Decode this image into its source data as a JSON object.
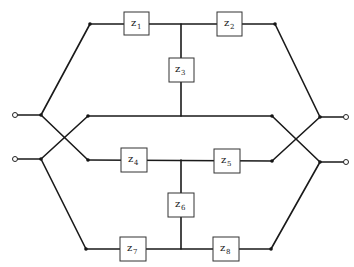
{
  "diagram": {
    "type": "circuit",
    "impedances": [
      {
        "id": "z1",
        "base": "z",
        "sub": "1"
      },
      {
        "id": "z2",
        "base": "z",
        "sub": "2"
      },
      {
        "id": "z3",
        "base": "z",
        "sub": "3"
      },
      {
        "id": "z4",
        "base": "z",
        "sub": "4"
      },
      {
        "id": "z5",
        "base": "z",
        "sub": "5"
      },
      {
        "id": "z6",
        "base": "z",
        "sub": "6"
      },
      {
        "id": "z7",
        "base": "z",
        "sub": "7"
      },
      {
        "id": "z8",
        "base": "z",
        "sub": "8"
      }
    ],
    "terminals": [
      "left-top",
      "left-bottom",
      "right-top",
      "right-bottom"
    ],
    "colors": {
      "line": "#1a1a1a",
      "box_fill": "#ffffff",
      "background": "#ffffff"
    }
  }
}
